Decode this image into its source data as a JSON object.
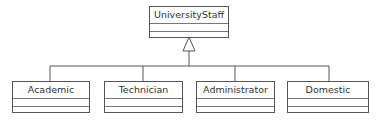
{
  "diagram": {
    "type": "uml-class-inheritance",
    "parent": {
      "name": "UniversityStaff"
    },
    "children": [
      {
        "name": "Academic"
      },
      {
        "name": "Technician"
      },
      {
        "name": "Administrator"
      },
      {
        "name": "Domestic"
      }
    ],
    "relationship": "generalization",
    "colors": {
      "line": "#555555",
      "text": "#333333",
      "background": "#ffffff"
    }
  }
}
